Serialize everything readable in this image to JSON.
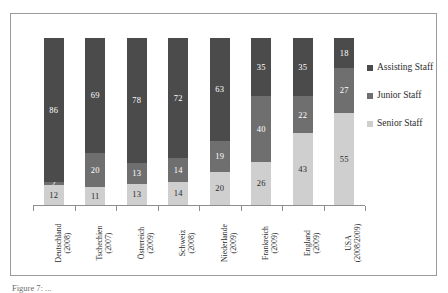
{
  "chart_data": {
    "type": "bar",
    "subtype": "stacked-100-percent",
    "title": "",
    "xlabel": "",
    "ylabel": "",
    "ylim": [
      0,
      100
    ],
    "grid": false,
    "legend_position": "right",
    "categories": [
      "Deutschland",
      "Tschechien",
      "Österreich",
      "Schweiz",
      "Niederlande",
      "Frankreich",
      "England",
      "USA"
    ],
    "category_years": [
      "(2008)",
      "(2007)",
      "(2009)",
      "(2008)",
      "(2009)",
      "(2009)",
      "(2009)",
      "(2008/2009)"
    ],
    "series": [
      {
        "name": "Assisting Staff",
        "color": "#4b4b4b",
        "values": [
          86,
          69,
          78,
          72,
          63,
          35,
          35,
          18
        ]
      },
      {
        "name": "Junior Staff",
        "color": "#6f6f6f",
        "values": [
          2,
          20,
          13,
          14,
          19,
          40,
          22,
          27
        ]
      },
      {
        "name": "Senior Staff",
        "color": "#cfcfcf",
        "values": [
          12,
          11,
          13,
          14,
          20,
          26,
          43,
          55
        ]
      }
    ]
  },
  "legend": {
    "items": [
      {
        "label": "Assisting Staff"
      },
      {
        "label": "Junior Staff"
      },
      {
        "label": "Senior Staff"
      }
    ]
  },
  "caption": {
    "text": "Figure 7: ... "
  }
}
